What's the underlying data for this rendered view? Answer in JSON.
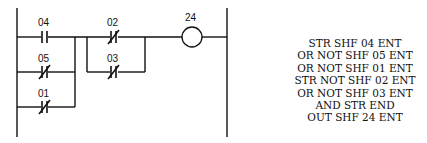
{
  "diagram": {
    "type": "ladder-logic",
    "contacts": [
      {
        "id": "04",
        "type": "normally-open"
      },
      {
        "id": "05",
        "type": "normally-closed"
      },
      {
        "id": "01",
        "type": "normally-closed"
      },
      {
        "id": "02",
        "type": "normally-closed"
      },
      {
        "id": "03",
        "type": "normally-closed"
      }
    ],
    "coil": {
      "id": "24"
    },
    "labels": {
      "c04": "04",
      "c05": "05",
      "c01": "01",
      "c02": "02",
      "c03": "03",
      "coil": "24"
    }
  },
  "mnemonic": {
    "lines": [
      "STR SHF 04 ENT",
      "OR NOT SHF 05 ENT",
      "OR NOT SHF 01 ENT",
      "STR NOT SHF 02 ENT",
      "OR NOT SHF 03 ENT",
      "AND STR END",
      "OUT SHF 24 ENT"
    ]
  }
}
